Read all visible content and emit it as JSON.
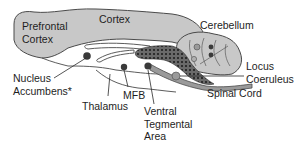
{
  "diagram": {
    "type": "brain-sagittal-section",
    "colors": {
      "brain_fill": "#c8c8c8",
      "brain_stroke": "#4a4a4a",
      "background": "#ffffff",
      "nucleus_dark": "#3a3a3a",
      "nucleus_light": "#9a9a9a",
      "pathway_fill": "#5a5a5a",
      "text": "#1e1e1e"
    },
    "labels": {
      "prefrontal_cortex": [
        "Prefrontal",
        "Cortex"
      ],
      "cortex": "Cortex",
      "cerebellum": "Cerebellum",
      "locus_coeruleus": [
        "Locus",
        "Coeruleus"
      ],
      "spinal_cord": "Spinal Cord",
      "nucleus_accumbens": [
        "Nucleus",
        "Accumbens*"
      ],
      "thalamus": "Thalamus",
      "mfb": "MFB",
      "ventral_tegmental_area": [
        "Ventral",
        "Tegmental",
        "Area"
      ]
    },
    "structures": [
      "prefrontal-cortex",
      "cortex",
      "cerebellum",
      "locus-coeruleus",
      "spinal-cord",
      "nucleus-accumbens",
      "thalamus",
      "medial-forebrain-bundle",
      "ventral-tegmental-area"
    ]
  }
}
